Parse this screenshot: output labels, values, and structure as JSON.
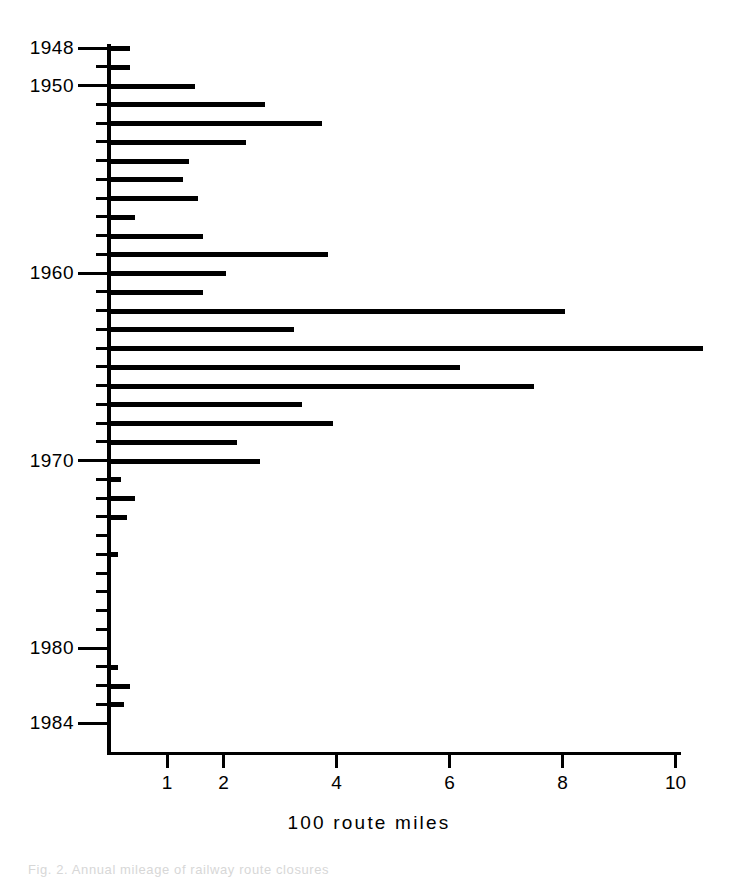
{
  "figure": {
    "caption_partial": "Fig. 2.  Annual mileage of railway route closures",
    "axis_caption": "100 route miles"
  },
  "chart_data": {
    "type": "bar",
    "orientation": "horizontal",
    "title": "",
    "subtitle": "",
    "xlabel": "100 route miles",
    "ylabel": "",
    "xlim": [
      0,
      10.6
    ],
    "ylim": [
      1948,
      1985
    ],
    "grid": false,
    "legend": false,
    "legend_position": "none",
    "x_ticks": [
      1,
      2,
      4,
      6,
      8,
      10
    ],
    "x_tick_labels": [
      "1",
      "2",
      "4",
      "6",
      "8",
      "10"
    ],
    "y_tick_labels": [
      "1948",
      "1950",
      "1960",
      "1970",
      "1980",
      "1984"
    ],
    "y_major_ticks": [
      1948,
      1950,
      1960,
      1970,
      1980,
      1984
    ],
    "categories": [
      "1948",
      "1949",
      "1950",
      "1951",
      "1952",
      "1953",
      "1954",
      "1955",
      "1956",
      "1957",
      "1958",
      "1959",
      "1960",
      "1961",
      "1962",
      "1963",
      "1964",
      "1965",
      "1966",
      "1967",
      "1968",
      "1969",
      "1970",
      "1971",
      "1972",
      "1973",
      "1974",
      "1975",
      "1976",
      "1977",
      "1978",
      "1979",
      "1980",
      "1981",
      "1982",
      "1983",
      "1984"
    ],
    "values": [
      0.35,
      0.35,
      1.5,
      2.75,
      3.75,
      2.4,
      1.4,
      1.3,
      1.55,
      0.45,
      1.65,
      3.85,
      2.05,
      1.65,
      8.05,
      3.25,
      10.5,
      6.2,
      7.5,
      3.4,
      3.95,
      2.25,
      2.65,
      0.2,
      0.45,
      0.3,
      0.0,
      0.15,
      0.0,
      0.0,
      0.0,
      0.0,
      0.0,
      0.15,
      0.35,
      0.25,
      0.0
    ]
  }
}
